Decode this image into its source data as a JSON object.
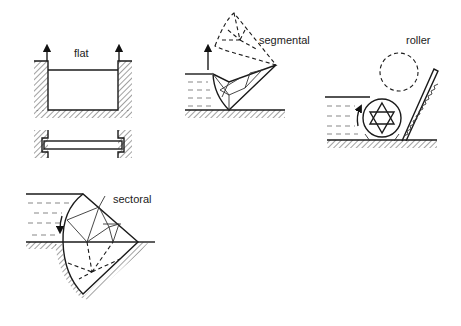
{
  "figure": {
    "panels": [
      {
        "id": "flat",
        "label": "flat"
      },
      {
        "id": "segmental",
        "label": "segmental"
      },
      {
        "id": "roller",
        "label": "roller"
      },
      {
        "id": "sectoral",
        "label": "sectoral"
      }
    ]
  },
  "colors": {
    "ink": "#1a1a1a",
    "background": "#ffffff"
  }
}
